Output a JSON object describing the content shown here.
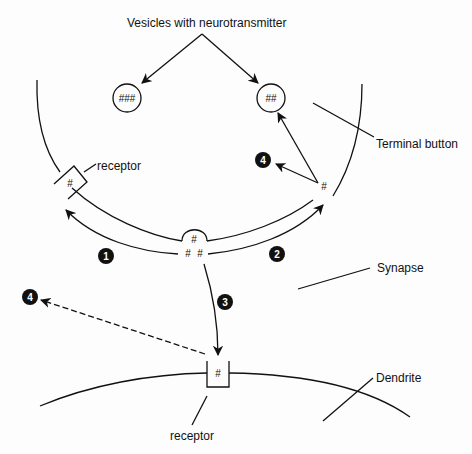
{
  "diagram": {
    "title_label": "Vesicles with neurotransmitter",
    "labels": {
      "terminal_button": "Terminal button",
      "synapse": "Synapse",
      "dendrite": "Dendrite",
      "presynaptic_receptor": "receptor",
      "postsynaptic_receptor": "receptor"
    },
    "vesicles": [
      {
        "name": "vesicle-left",
        "content": "###"
      },
      {
        "name": "vesicle-right",
        "content": "##"
      }
    ],
    "molecules": {
      "presynaptic_receptor_symbol": "#",
      "release_top": "#",
      "release_left": "#",
      "release_right": "#",
      "reuptake_symbol": "#",
      "postsynaptic_receptor_symbol": "#"
    },
    "steps": [
      {
        "id": "1",
        "label": "1"
      },
      {
        "id": "2",
        "label": "2"
      },
      {
        "id": "3",
        "label": "3"
      },
      {
        "id": "4a",
        "label": "4"
      },
      {
        "id": "4b",
        "label": "4"
      }
    ],
    "colors": {
      "ink": "#111111",
      "background": "#fdfdfd",
      "badge": "#111111"
    }
  }
}
